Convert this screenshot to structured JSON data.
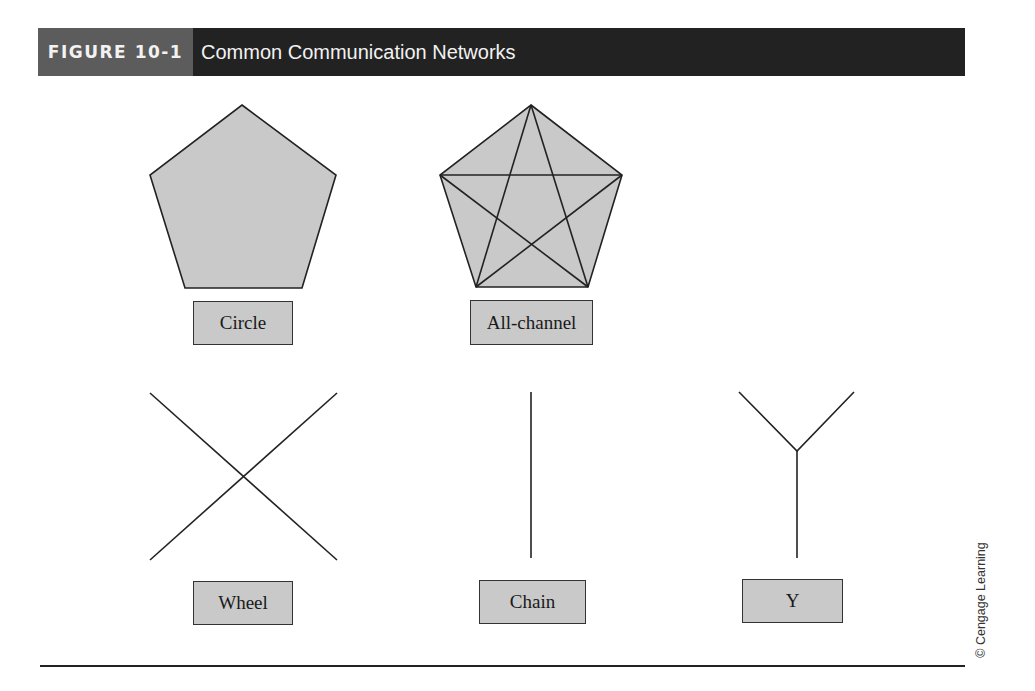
{
  "figure": {
    "label": "FIGURE 10-1",
    "title": "Common Communication Networks"
  },
  "colors": {
    "header_dark": "#222222",
    "header_label_bg": "#5c5c5c",
    "shape_fill": "#c9c9c9",
    "line": "#222222"
  },
  "networks": [
    {
      "id": "circle",
      "label": "Circle",
      "shape": "pentagon",
      "edges": "perimeter"
    },
    {
      "id": "all-channel",
      "label": "All-channel",
      "shape": "pentagon",
      "edges": "perimeter+all-diagonals"
    },
    {
      "id": "wheel",
      "label": "Wheel",
      "shape": "x-cross",
      "edges": "4 spokes to center"
    },
    {
      "id": "chain",
      "label": "Chain",
      "shape": "vertical-line",
      "edges": "single line"
    },
    {
      "id": "y",
      "label": "Y",
      "shape": "y-fork",
      "edges": "2 arms + stem"
    }
  ],
  "credit": "© Cengage Learning"
}
